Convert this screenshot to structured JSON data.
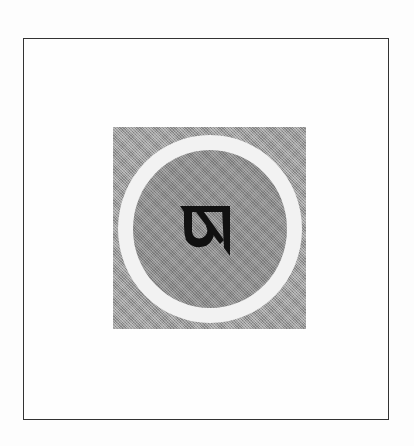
{
  "figure": {
    "glyph": "ཨ",
    "glyph_name": "tibetan-letter-a",
    "colors": {
      "frame_border": "#333333",
      "background": "#fdfdfd",
      "square_fill": "#9a9a9a",
      "ring": "#f2f2f2",
      "disc": "#8a8a8a",
      "glyph": "#111111"
    }
  }
}
